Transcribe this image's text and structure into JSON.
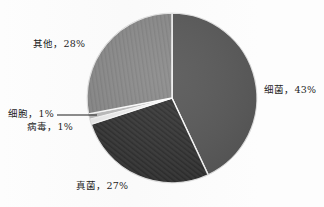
{
  "chart_data": {
    "type": "pie",
    "title": "",
    "categories": [
      "细菌",
      "真菌",
      "其他",
      "细胞",
      "病毒"
    ],
    "values": [
      43,
      27,
      28,
      1,
      1
    ],
    "unit": "%",
    "labels": [
      {
        "name": "细菌",
        "value": 43,
        "text": "细菌，43%"
      },
      {
        "name": "真菌",
        "value": 27,
        "text": "真菌，27%"
      },
      {
        "name": "其他",
        "value": 28,
        "text": "其他，28%"
      },
      {
        "name": "细胞",
        "value": 1,
        "text": "细胞，1%"
      },
      {
        "name": "病毒",
        "value": 1,
        "text": "病毒，1%"
      }
    ],
    "legend": "none",
    "grid": false,
    "start_angle_deg": 0,
    "direction": "clockwise",
    "colors": {
      "bacteria": "#595959",
      "fungi": "#3a3a3a",
      "other": "#8c8c8c",
      "cell": "#bfbfbf",
      "virus": "#f2f2f2",
      "background": "#ffffff",
      "text": "#1d1d1d",
      "slice_border": "#ffffff"
    },
    "fills": {
      "bacteria": "solid",
      "fungi": "diagonal-hatch",
      "other": "vertical-hatch",
      "cell": "solid",
      "virus": "solid"
    }
  },
  "labels": {
    "other": "其他，28%",
    "bacteria": "细菌，43%",
    "cell": "细胞，1%",
    "virus": "病毒，1%",
    "fungi": "真菌，27%"
  }
}
